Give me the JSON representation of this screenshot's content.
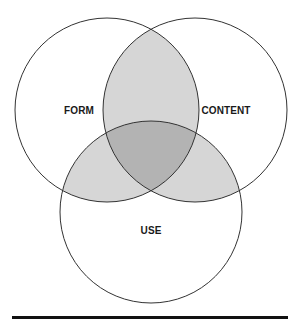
{
  "diagram": {
    "type": "venn-3",
    "colors": {
      "background": "#ffffff",
      "outline": "#333333",
      "pair_overlap": "#d6d6d6",
      "triple_overlap": "#b3b3b3",
      "rule": "#111111"
    },
    "sets": [
      {
        "id": "form",
        "label": "FORM",
        "cx": 107,
        "cy": 110,
        "r": 92,
        "label_x": 79,
        "label_y": 110
      },
      {
        "id": "content",
        "label": "CONTENT",
        "cx": 195,
        "cy": 110,
        "r": 92,
        "label_x": 226,
        "label_y": 110
      },
      {
        "id": "use",
        "label": "USE",
        "cx": 151,
        "cy": 212,
        "r": 91,
        "label_x": 151,
        "label_y": 230
      }
    ],
    "shaded_regions": [
      "form∩content",
      "form∩use",
      "content∩use",
      "form∩content∩use"
    ]
  }
}
